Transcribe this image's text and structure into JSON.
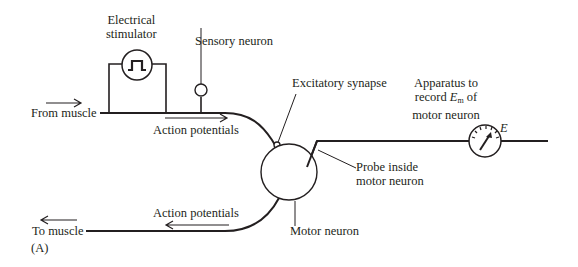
{
  "figure": {
    "panel_label": "(A)",
    "labels": {
      "electrical_stimulator": [
        "Electrical",
        "stimulator"
      ],
      "sensory_neuron": "Sensory neuron",
      "from_muscle": "From muscle",
      "action_potentials_top": "Action potentials",
      "excitatory_synapse": "Excitatory synapse",
      "apparatus": [
        "Apparatus to",
        "record",
        "E",
        "m",
        "of",
        "motor neuron"
      ],
      "gauge_symbol": "E",
      "probe": [
        "Probe inside",
        "motor neuron"
      ],
      "action_potentials_bottom": "Action potentials",
      "to_muscle": "To muscle",
      "motor_neuron": "Motor neuron"
    },
    "colors": {
      "ink": "#231f20",
      "background": "#ffffff"
    }
  }
}
